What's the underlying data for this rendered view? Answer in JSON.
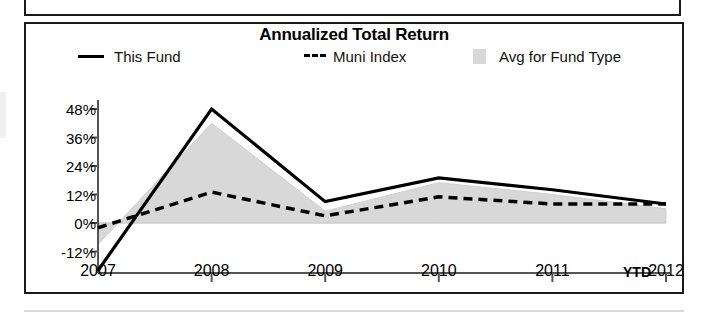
{
  "page": {
    "background_color": "#ffffff",
    "border_color": "#1a1a1a"
  },
  "panel": {
    "title": "Annualized Total Return"
  },
  "legend": {
    "position": "top",
    "items": [
      {
        "label": "This Fund",
        "style": "solid-line",
        "color": "#000000",
        "icon": "line-solid-icon"
      },
      {
        "label": "Muni Index",
        "style": "dashed-line",
        "color": "#000000",
        "icon": "line-dashed-icon"
      },
      {
        "label": "Avg for Fund Type",
        "style": "filled-area",
        "color": "#d8d8d8",
        "icon": "swatch-icon"
      }
    ]
  },
  "axes": {
    "y_ticks": [
      "48%",
      "36%",
      "24%",
      "12%",
      "0%",
      "-12%"
    ],
    "x_ticks": [
      "2007",
      "2008",
      "2009",
      "2010",
      "2011",
      "2012"
    ],
    "x_suffix": "YTD"
  },
  "chart_data": {
    "type": "line",
    "title": "Annualized Total Return",
    "xlabel": "",
    "ylabel": "",
    "categories": [
      "2007",
      "2008",
      "2009",
      "2010",
      "2011",
      "2012"
    ],
    "x_tick_labels": [
      "2007",
      "2008",
      "2009",
      "2010",
      "2011",
      "2012 YTD"
    ],
    "y_tick_labels": [
      "48%",
      "36%",
      "24%",
      "12%",
      "0%",
      "-12%"
    ],
    "y_tick_values": [
      48,
      36,
      24,
      12,
      0,
      -12
    ],
    "ylim": [
      -20,
      50
    ],
    "xlim": [
      "2007",
      "2012"
    ],
    "grid": false,
    "legend_position": "top",
    "units": "percent",
    "series": [
      {
        "name": "This Fund",
        "style": "solid-line",
        "color": "#000000",
        "values": [
          -20,
          48,
          9,
          19,
          14,
          8
        ]
      },
      {
        "name": "Muni Index",
        "style": "dashed-line",
        "color": "#000000",
        "values": [
          -2,
          13,
          3,
          11,
          8,
          8
        ]
      },
      {
        "name": "Avg for Fund Type",
        "style": "filled-area",
        "color": "#d8d8d8",
        "values": [
          -9,
          42,
          5,
          17,
          12,
          6
        ]
      }
    ]
  }
}
